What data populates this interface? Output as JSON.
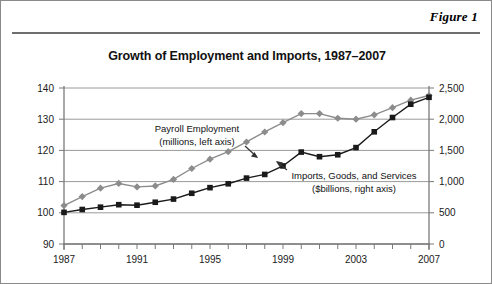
{
  "figure": {
    "label": "Figure 1"
  },
  "chart_data": {
    "type": "line",
    "title": "Growth of Employment and Imports, 1987–2007",
    "xlabel": "",
    "ylabel": "",
    "grid": true,
    "legend_position": "inline-annotation",
    "x": [
      1987,
      1988,
      1989,
      1990,
      1991,
      1992,
      1993,
      1994,
      1995,
      1996,
      1997,
      1998,
      1999,
      2000,
      2001,
      2002,
      2003,
      2004,
      2005,
      2006,
      2007
    ],
    "x_tick_labels": [
      "1987",
      "1991",
      "1995",
      "1999",
      "2003",
      "2007"
    ],
    "x_tick_values": [
      1987,
      1991,
      1995,
      1999,
      2003,
      2007
    ],
    "axes": [
      {
        "id": "left",
        "label": "Payroll Employment (millions, left axis)",
        "ylim": [
          90,
          140
        ],
        "ticks": [
          90,
          100,
          110,
          120,
          130,
          140
        ],
        "tick_labels": [
          "90",
          "100",
          "110",
          "120",
          "130",
          "140"
        ]
      },
      {
        "id": "right",
        "label": "Imports, Goods, and Services ($billions, right axis)",
        "ylim": [
          0,
          2500
        ],
        "ticks": [
          0,
          500,
          1000,
          1500,
          2000,
          2500
        ],
        "tick_labels": [
          "0",
          "500",
          "1,000",
          "1,500",
          "2,000",
          "2,500"
        ]
      }
    ],
    "series": [
      {
        "name": "Payroll Employment",
        "axis": "left",
        "units": "millions",
        "color": "#8c8c8c",
        "marker": "diamond",
        "annotation_line1": "Payroll Employment",
        "annotation_line2": "(millions, left axis)",
        "values": [
          102.3,
          105.2,
          107.9,
          109.4,
          108.3,
          108.6,
          110.7,
          114.2,
          117.2,
          119.6,
          122.7,
          125.9,
          128.9,
          131.8,
          131.8,
          130.3,
          130.0,
          131.4,
          133.7,
          136.1,
          137.6
        ]
      },
      {
        "name": "Imports, Goods, and Services",
        "axis": "right",
        "units": "$billions",
        "color": "#1a1a1a",
        "marker": "square",
        "annotation_line1": "Imports, Goods, and Services",
        "annotation_line2": "($billions, right axis)",
        "values": [
          507,
          553,
          590,
          630,
          622,
          669,
          720,
          813,
          903,
          965,
          1056,
          1115,
          1251,
          1473,
          1399,
          1430,
          1545,
          1798,
          2027,
          2240,
          2351
        ]
      }
    ]
  }
}
